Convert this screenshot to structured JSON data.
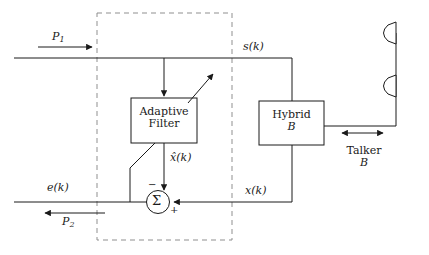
{
  "diagram": {
    "background_color": "#ffffff",
    "line_color": "#1a1a1a",
    "dashed_boundary_color": "#8f8f8f",
    "blocks": [
      {
        "id": "adaptive-filter",
        "line1": "Adaptive",
        "line2": "Filter"
      },
      {
        "id": "hybrid-b",
        "line1": "Hybrid",
        "line2": "B"
      }
    ],
    "summing_junction": {
      "symbol": "Σ",
      "minus_sign": "−",
      "plus_sign": "+"
    },
    "signals": {
      "p1": "P",
      "p1_sub": "1",
      "p2": "P",
      "p2_sub": "2",
      "s_k": "s(k)",
      "x_k": "x(k)",
      "x_hat_k": "x̂(k)",
      "e_k": "e(k)"
    },
    "annotations": {
      "talker_line1": "Talker",
      "talker_line2": "B"
    }
  }
}
